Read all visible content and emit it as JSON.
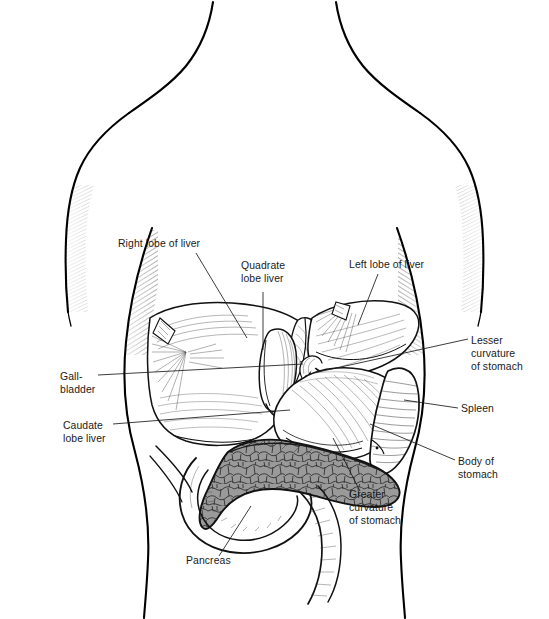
{
  "figure": {
    "background_color": "#ffffff",
    "ink_color": "#000000",
    "label_text_color": "#1a1a1a",
    "leader_line_color": "#1a1a1a",
    "pancreas_fill_color": "#9a9a9a",
    "organ_fill_color": "#ffffff",
    "label_font_size_px": 10.4
  },
  "labels": [
    {
      "id": "right-lobe-of-liver",
      "lines": [
        "Right lobe of liver"
      ],
      "text_x": 118,
      "text_y": 247,
      "anchor": "start",
      "leader": "M 196,253 L 247,338"
    },
    {
      "id": "quadrate-lobe-liver",
      "lines": [
        "Quadrate",
        "lobe liver"
      ],
      "text_x": 241,
      "text_y": 269,
      "anchor": "start",
      "leader": "M 263,292 L 263,350"
    },
    {
      "id": "left-lobe-of-liver",
      "lines": [
        "Left lobe of liver"
      ],
      "text_x": 349,
      "text_y": 268,
      "anchor": "start",
      "leader": "M 378,274 L 358,325"
    },
    {
      "id": "lesser-curvature-of-stomach",
      "lines": [
        "Lesser",
        "curvature",
        "of  stomach"
      ],
      "text_x": 471,
      "text_y": 344,
      "anchor": "start",
      "leader": "M 468,339 L 309,374"
    },
    {
      "id": "spleen",
      "lines": [
        "Spleen"
      ],
      "text_x": 461,
      "text_y": 412,
      "anchor": "start",
      "leader": "M 458,408 L 404,400"
    },
    {
      "id": "body-of-stomach",
      "lines": [
        "Body of",
        "stomach"
      ],
      "text_x": 458,
      "text_y": 465,
      "anchor": "start",
      "leader": "M 455,460 L 370,424"
    },
    {
      "id": "greater-curvature-of-stomach",
      "lines": [
        "Greater",
        "curvature",
        "of stomach"
      ],
      "text_x": 349,
      "text_y": 498,
      "anchor": "start",
      "leader": "M 360,491 L 333,438"
    },
    {
      "id": "pancreas",
      "lines": [
        "Pancreas"
      ],
      "text_x": 186,
      "text_y": 564,
      "anchor": "start",
      "leader": "M 219,556 L 251,506"
    },
    {
      "id": "caudate-lobe-liver",
      "lines": [
        "Caudate",
        "lobe liver"
      ],
      "text_x": 63,
      "text_y": 429,
      "anchor": "start",
      "leader": "M 113,424 L 290,410"
    },
    {
      "id": "gall-bladder",
      "lines": [
        "Gall-",
        "bladder"
      ],
      "text_x": 60,
      "text_y": 380,
      "anchor": "start",
      "leader": "M 98,375 L 303,364"
    }
  ]
}
